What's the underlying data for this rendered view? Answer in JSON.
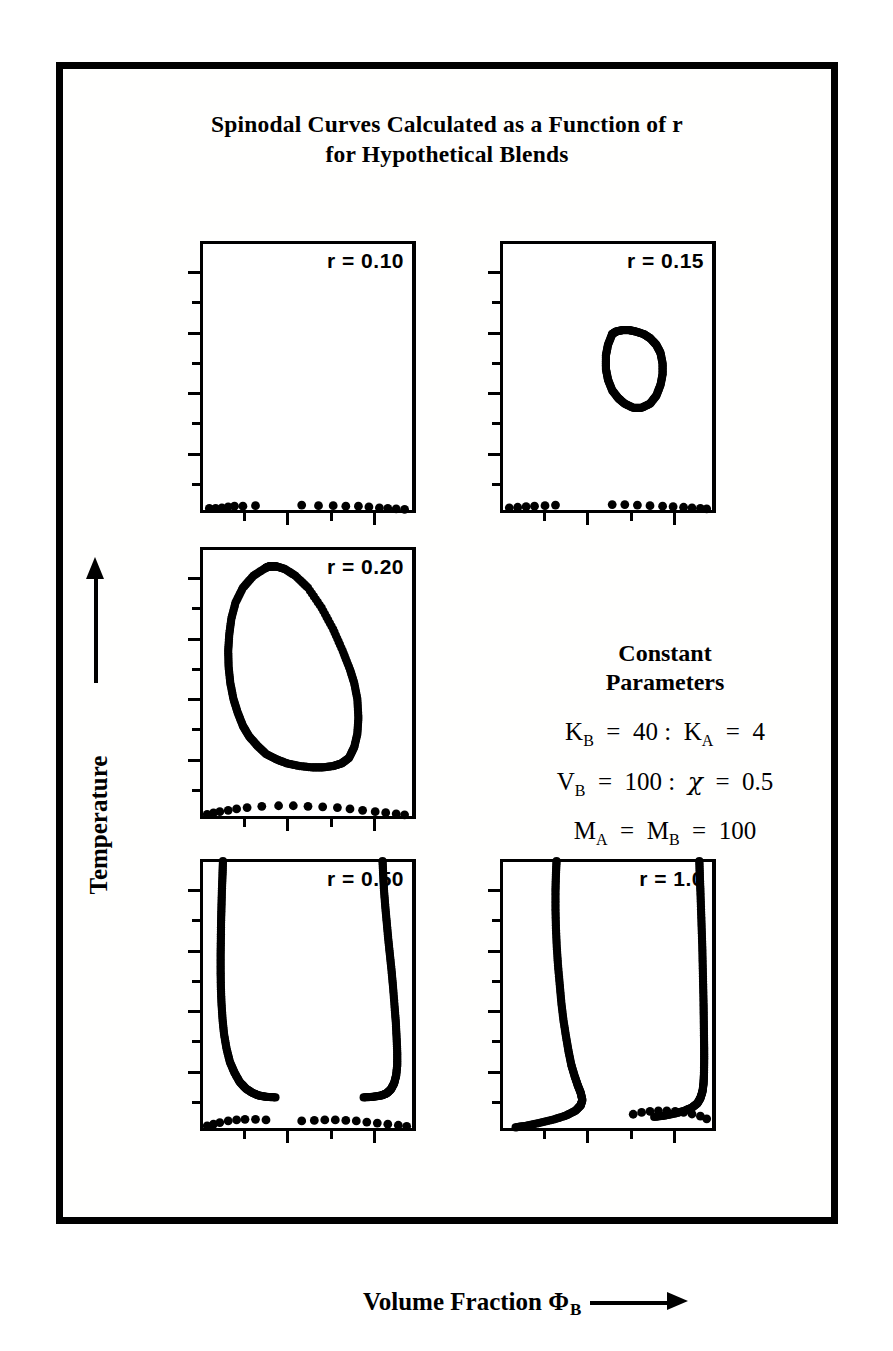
{
  "figure": {
    "title_line1": "Spinodal Curves Calculated as a Function of r",
    "title_line2": "for Hypothetical Blends",
    "caption": "",
    "axis": {
      "y_label": "Temperature",
      "x_label_main": "Volume Fraction",
      "x_label_symbol": "Φ",
      "x_label_subscript": "B",
      "y_arrow": "up-arrow",
      "x_arrow": "right-arrow"
    },
    "colors": {
      "ink": "#000000",
      "paper": "#ffffff"
    }
  },
  "constant_parameters": {
    "heading_line1": "Constant",
    "heading_line2": "Parameters",
    "equations": [
      {
        "lhs_sym": "K",
        "lhs_sub": "B",
        "lhs_val": "40",
        "rhs_sym": "K",
        "rhs_sub": "A",
        "rhs_val": "4",
        "text": "K_B = 40 : K_A = 4"
      },
      {
        "lhs_sym": "V",
        "lhs_sub": "B",
        "lhs_val": "100",
        "rhs_sym": "χ",
        "rhs_sub": "",
        "rhs_val": "0.5",
        "text": "V_B = 100 : χ = 0.5"
      },
      {
        "lhs_sym": "M",
        "lhs_sub": "A",
        "lhs_val": "",
        "rhs_sym": "M",
        "rhs_sub": "B",
        "rhs_val": "100",
        "text": "M_A = M_B = 100"
      }
    ]
  },
  "chart_data": {
    "type": "scatter",
    "title": "Spinodal Curves Calculated as a Function of r for Hypothetical Blends",
    "xlabel": "Volume Fraction Φ_B",
    "ylabel": "Temperature",
    "xlim": [
      0,
      1
    ],
    "ylim": [
      0,
      1
    ],
    "grid": false,
    "legend": "none",
    "axis_ticks_unlabeled": true,
    "y_major_ticks": 5,
    "y_minor_ticks": 4,
    "x_major_ticks": 4,
    "panels": [
      {
        "id": "panel-r-010",
        "label": "r = 0.10",
        "r": 0.1,
        "description": "No spinodal loop; points lie only along the bottom axis",
        "series": [
          {
            "name": "bottom-axis-points",
            "x": [
              0.03,
              0.06,
              0.09,
              0.12,
              0.15,
              0.19,
              0.25,
              0.47,
              0.55,
              0.62,
              0.68,
              0.74,
              0.79,
              0.84,
              0.88,
              0.92,
              0.96
            ],
            "y": [
              0.01,
              0.01,
              0.012,
              0.015,
              0.018,
              0.018,
              0.02,
              0.022,
              0.02,
              0.02,
              0.018,
              0.018,
              0.015,
              0.012,
              0.01,
              0.008,
              0.006
            ]
          }
        ]
      },
      {
        "id": "panel-r-015",
        "label": "r = 0.15",
        "r": 0.15,
        "description": "Small closed immiscibility loop in the upper-middle-right region plus bottom-axis points",
        "series": [
          {
            "name": "closed-loop",
            "x": [
              0.52,
              0.5,
              0.49,
              0.49,
              0.5,
              0.52,
              0.55,
              0.58,
              0.62,
              0.66,
              0.7,
              0.73,
              0.75,
              0.76,
              0.76,
              0.75,
              0.73,
              0.7,
              0.67,
              0.63,
              0.6,
              0.57,
              0.54,
              0.52
            ],
            "y": [
              0.66,
              0.62,
              0.58,
              0.53,
              0.49,
              0.45,
              0.42,
              0.4,
              0.385,
              0.385,
              0.4,
              0.43,
              0.47,
              0.51,
              0.55,
              0.59,
              0.62,
              0.645,
              0.66,
              0.67,
              0.675,
              0.675,
              0.67,
              0.66
            ]
          },
          {
            "name": "bottom-axis-points",
            "x": [
              0.03,
              0.07,
              0.11,
              0.15,
              0.2,
              0.25,
              0.52,
              0.58,
              0.64,
              0.7,
              0.76,
              0.81,
              0.86,
              0.9,
              0.94,
              0.97
            ],
            "y": [
              0.012,
              0.014,
              0.016,
              0.018,
              0.02,
              0.022,
              0.024,
              0.024,
              0.022,
              0.02,
              0.018,
              0.016,
              0.014,
              0.012,
              0.01,
              0.008
            ]
          }
        ]
      },
      {
        "id": "panel-r-020",
        "label": "r = 0.20",
        "r": 0.2,
        "description": "Large closed spinodal loop spanning most of the panel plus bottom-axis points",
        "series": [
          {
            "name": "closed-loop",
            "x": [
              0.3,
              0.24,
              0.19,
              0.155,
              0.135,
              0.125,
              0.12,
              0.122,
              0.13,
              0.145,
              0.165,
              0.19,
              0.22,
              0.26,
              0.3,
              0.35,
              0.4,
              0.46,
              0.52,
              0.57,
              0.62,
              0.66,
              0.695,
              0.72,
              0.735,
              0.74,
              0.735,
              0.72,
              0.7,
              0.665,
              0.62,
              0.565,
              0.5,
              0.44,
              0.39,
              0.35,
              0.33,
              0.315,
              0.3
            ],
            "y": [
              0.93,
              0.9,
              0.855,
              0.8,
              0.74,
              0.68,
              0.62,
              0.56,
              0.5,
              0.44,
              0.39,
              0.34,
              0.3,
              0.265,
              0.235,
              0.215,
              0.2,
              0.19,
              0.185,
              0.185,
              0.19,
              0.2,
              0.22,
              0.26,
              0.31,
              0.37,
              0.44,
              0.5,
              0.55,
              0.62,
              0.7,
              0.78,
              0.855,
              0.9,
              0.925,
              0.935,
              0.935,
              0.935,
              0.93
            ]
          },
          {
            "name": "bottom-axis-points",
            "x": [
              0.02,
              0.05,
              0.08,
              0.12,
              0.16,
              0.21,
              0.28,
              0.36,
              0.43,
              0.5,
              0.57,
              0.64,
              0.7,
              0.76,
              0.82,
              0.87,
              0.92,
              0.96
            ],
            "y": [
              0.01,
              0.015,
              0.02,
              0.025,
              0.03,
              0.035,
              0.04,
              0.042,
              0.042,
              0.04,
              0.038,
              0.035,
              0.03,
              0.025,
              0.02,
              0.016,
              0.012,
              0.008
            ]
          }
        ]
      },
      {
        "id": "panel-r-050",
        "label": "r = 0.50",
        "r": 0.5,
        "description": "Two steep branches meeting the top of the panel, curving inward near the bottom; plus bottom-axis points",
        "series": [
          {
            "name": "left-branch",
            "x": [
              0.095,
              0.093,
              0.09,
              0.088,
              0.086,
              0.085,
              0.084,
              0.084,
              0.085,
              0.088,
              0.093,
              0.1,
              0.112,
              0.128,
              0.15,
              0.175,
              0.205,
              0.235,
              0.265,
              0.3,
              0.345
            ],
            "y": [
              1.0,
              0.95,
              0.89,
              0.83,
              0.77,
              0.71,
              0.65,
              0.59,
              0.53,
              0.47,
              0.41,
              0.355,
              0.3,
              0.25,
              0.21,
              0.175,
              0.15,
              0.135,
              0.125,
              0.12,
              0.118
            ]
          },
          {
            "name": "right-branch",
            "x": [
              0.855,
              0.858,
              0.862,
              0.868,
              0.875,
              0.882,
              0.89,
              0.898,
              0.905,
              0.912,
              0.918,
              0.922,
              0.925,
              0.925,
              0.92,
              0.91,
              0.895,
              0.875,
              0.85,
              0.81,
              0.765
            ],
            "y": [
              1.0,
              0.95,
              0.89,
              0.83,
              0.77,
              0.71,
              0.65,
              0.59,
              0.53,
              0.46,
              0.4,
              0.34,
              0.285,
              0.24,
              0.2,
              0.17,
              0.148,
              0.133,
              0.125,
              0.12,
              0.118
            ]
          },
          {
            "name": "bottom-axis-points",
            "x": [
              0.02,
              0.05,
              0.08,
              0.12,
              0.16,
              0.2,
              0.25,
              0.3,
              0.47,
              0.53,
              0.58,
              0.63,
              0.68,
              0.73,
              0.78,
              0.83,
              0.88,
              0.93,
              0.97
            ],
            "y": [
              0.012,
              0.018,
              0.024,
              0.03,
              0.034,
              0.036,
              0.036,
              0.034,
              0.03,
              0.032,
              0.034,
              0.034,
              0.032,
              0.03,
              0.026,
              0.022,
              0.018,
              0.014,
              0.01
            ]
          }
        ]
      },
      {
        "id": "panel-r-100",
        "label": "r = 1.0",
        "r": 1.0,
        "description": "Two nearly vertical branches reaching the top of the panel with sharp hooks at the bottom; plus bottom-axis points",
        "series": [
          {
            "name": "left-branch",
            "x": [
              0.255,
              0.252,
              0.25,
              0.25,
              0.252,
              0.256,
              0.262,
              0.27,
              0.278,
              0.288,
              0.3,
              0.312,
              0.325,
              0.34,
              0.355,
              0.37,
              0.378,
              0.37,
              0.345,
              0.3,
              0.24,
              0.17,
              0.11,
              0.06
            ],
            "y": [
              1.0,
              0.95,
              0.89,
              0.82,
              0.75,
              0.68,
              0.61,
              0.54,
              0.47,
              0.405,
              0.345,
              0.29,
              0.24,
              0.2,
              0.165,
              0.135,
              0.108,
              0.088,
              0.068,
              0.05,
              0.035,
              0.022,
              0.012,
              0.006
            ]
          },
          {
            "name": "right-branch",
            "x": [
              0.935,
              0.937,
              0.94,
              0.943,
              0.946,
              0.949,
              0.951,
              0.953,
              0.955,
              0.956,
              0.957,
              0.958,
              0.958,
              0.957,
              0.955,
              0.95,
              0.94,
              0.925,
              0.9,
              0.865,
              0.82,
              0.77,
              0.72
            ],
            "y": [
              1.0,
              0.95,
              0.89,
              0.82,
              0.75,
              0.68,
              0.61,
              0.54,
              0.47,
              0.41,
              0.35,
              0.3,
              0.25,
              0.205,
              0.17,
              0.14,
              0.115,
              0.095,
              0.08,
              0.068,
              0.058,
              0.05,
              0.045
            ]
          },
          {
            "name": "bottom-axis-points",
            "x": [
              0.62,
              0.66,
              0.7,
              0.74,
              0.78,
              0.82,
              0.86,
              0.9,
              0.94,
              0.97
            ],
            "y": [
              0.055,
              0.062,
              0.066,
              0.068,
              0.068,
              0.066,
              0.062,
              0.056,
              0.048,
              0.038
            ]
          }
        ]
      }
    ]
  }
}
